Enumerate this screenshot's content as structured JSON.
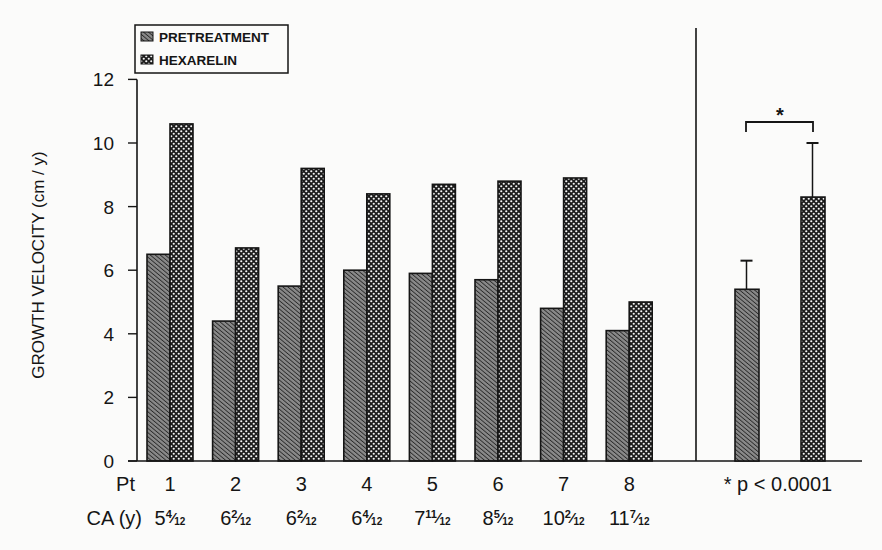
{
  "chart_data": {
    "type": "bar",
    "title": "",
    "xlabel": "",
    "ylabel": "GROWTH VELOCITY (cm / y)",
    "ylim": [
      0,
      12
    ],
    "yticks": [
      0,
      2,
      4,
      6,
      8,
      10,
      12
    ],
    "grid": false,
    "legend_position": "top-left",
    "legend": [
      {
        "name": "PRETREATMENT",
        "pattern": "diagonal-hatch"
      },
      {
        "name": "HEXARELIN",
        "pattern": "crosshatch-dots"
      }
    ],
    "row_labels": {
      "patient": "Pt",
      "age": "CA (y)"
    },
    "categories": [
      "1",
      "2",
      "3",
      "4",
      "5",
      "6",
      "7",
      "8"
    ],
    "chronological_age": [
      {
        "whole": "5",
        "num": "4",
        "den": "12"
      },
      {
        "whole": "6",
        "num": "2",
        "den": "12"
      },
      {
        "whole": "6",
        "num": "2",
        "den": "12"
      },
      {
        "whole": "6",
        "num": "4",
        "den": "12"
      },
      {
        "whole": "7",
        "num": "11",
        "den": "12"
      },
      {
        "whole": "8",
        "num": "5",
        "den": "12"
      },
      {
        "whole": "10",
        "num": "2",
        "den": "12"
      },
      {
        "whole": "11",
        "num": "7",
        "den": "12"
      }
    ],
    "series": [
      {
        "name": "PRETREATMENT",
        "values": [
          6.5,
          4.4,
          5.5,
          6.0,
          5.9,
          5.7,
          4.8,
          4.1
        ]
      },
      {
        "name": "HEXARELIN",
        "values": [
          10.6,
          6.7,
          9.2,
          8.4,
          8.7,
          8.8,
          8.9,
          5.0
        ]
      }
    ],
    "summary": {
      "series": [
        {
          "name": "PRETREATMENT",
          "mean": 5.4,
          "error_upper": 6.3
        },
        {
          "name": "HEXARELIN",
          "mean": 8.3,
          "error_upper": 10.0
        }
      ],
      "significance_marker": "*",
      "annotation": "* p < 0.0001"
    }
  }
}
